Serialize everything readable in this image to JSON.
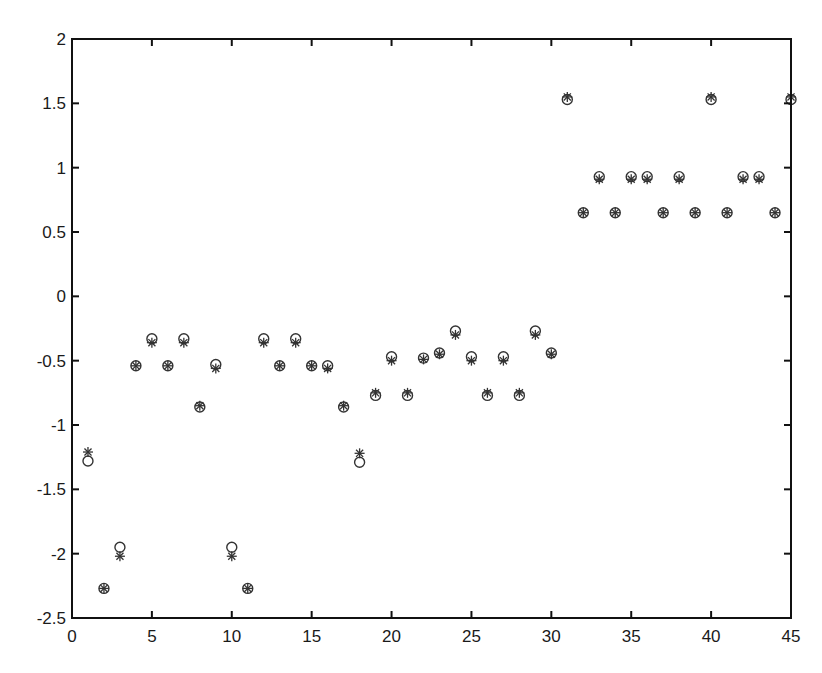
{
  "chart_data": {
    "type": "scatter",
    "title": "",
    "xlabel": "",
    "ylabel": "",
    "xlim": [
      0,
      45
    ],
    "ylim": [
      -2.5,
      2
    ],
    "grid": false,
    "legend": null,
    "xticks": [
      "0",
      "5",
      "10",
      "15",
      "20",
      "25",
      "30",
      "35",
      "40",
      "45"
    ],
    "yticks": [
      "2",
      "1.5",
      "1",
      "0.5",
      "0",
      "-0.5",
      "-1",
      "-1.5",
      "-2",
      "-2.5"
    ],
    "x": [
      1,
      2,
      3,
      4,
      5,
      6,
      7,
      8,
      9,
      10,
      11,
      12,
      13,
      14,
      15,
      16,
      17,
      18,
      19,
      20,
      21,
      22,
      23,
      24,
      25,
      26,
      27,
      28,
      29,
      30,
      31,
      32,
      33,
      34,
      35,
      36,
      37,
      38,
      39,
      40,
      41,
      42,
      43,
      44,
      45
    ],
    "series": [
      {
        "name": "circles",
        "marker": "o",
        "values": [
          -1.28,
          -2.27,
          -1.95,
          -0.54,
          -0.33,
          -0.54,
          -0.33,
          -0.86,
          -0.53,
          -1.95,
          -2.27,
          -0.33,
          -0.54,
          -0.33,
          -0.54,
          -0.54,
          -0.86,
          -1.29,
          -0.77,
          -0.47,
          -0.77,
          -0.48,
          -0.44,
          -0.27,
          -0.47,
          -0.77,
          -0.47,
          -0.77,
          -0.27,
          -0.44,
          1.53,
          0.65,
          0.93,
          0.65,
          0.93,
          0.93,
          0.65,
          0.93,
          0.65,
          1.53,
          0.65,
          0.93,
          0.93,
          0.65,
          1.53
        ]
      },
      {
        "name": "stars",
        "marker": "*",
        "values": [
          -1.21,
          -2.27,
          -2.02,
          -0.54,
          -0.36,
          -0.54,
          -0.36,
          -0.85,
          -0.56,
          -2.02,
          -2.27,
          -0.36,
          -0.54,
          -0.36,
          -0.54,
          -0.56,
          -0.85,
          -1.22,
          -0.75,
          -0.5,
          -0.75,
          -0.49,
          -0.45,
          -0.3,
          -0.5,
          -0.75,
          -0.5,
          -0.75,
          -0.3,
          -0.45,
          1.55,
          0.65,
          0.91,
          0.65,
          0.91,
          0.91,
          0.65,
          0.91,
          0.65,
          1.55,
          0.65,
          0.91,
          0.91,
          0.65,
          1.55
        ]
      }
    ]
  },
  "style": {
    "axis_color": "#111111",
    "marker_color": "#333333"
  }
}
